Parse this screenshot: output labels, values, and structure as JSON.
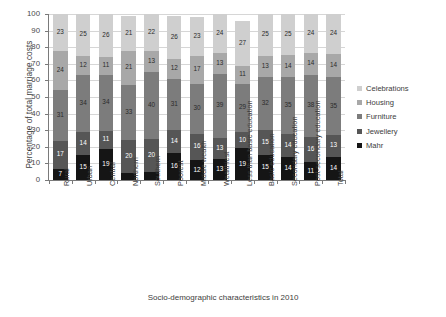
{
  "chart_data": {
    "type": "bar",
    "stacked": true,
    "title": "",
    "xlabel": "Socio-demographic characteristics in 2010",
    "ylabel": "Percentage of total marriage costs",
    "ylim": [
      0,
      100
    ],
    "ytick_step": 10,
    "yticks": [
      "100",
      "90",
      "80",
      "70",
      "60",
      "50",
      "40",
      "30",
      "20",
      "10",
      "0"
    ],
    "grid": true,
    "legend_position": "right",
    "categories": [
      "Rural",
      "Urban",
      "Central",
      "Northern",
      "Southern",
      "Poorest",
      "Middle wealth",
      "Wealthiest",
      "Less than basic education",
      "Basic education",
      "Secondary education",
      "Post-secondary education",
      "Total"
    ],
    "series": [
      {
        "name": "Mahr",
        "color": "#151515",
        "values": [
          7,
          15,
          19,
          4,
          5,
          16,
          12,
          13,
          19,
          15,
          14,
          11,
          14
        ]
      },
      {
        "name": "Jewellery",
        "color": "#565656",
        "values": [
          17,
          14,
          11,
          20,
          20,
          14,
          16,
          13,
          10,
          15,
          14,
          16,
          13
        ]
      },
      {
        "name": "Furniture",
        "color": "#7c7c7c",
        "values": [
          31,
          34,
          34,
          33,
          40,
          31,
          30,
          39,
          29,
          32,
          35,
          38,
          35
        ]
      },
      {
        "name": "Housing",
        "color": "#a8a8a8",
        "values": [
          24,
          12,
          11,
          21,
          13,
          12,
          17,
          13,
          11,
          13,
          14,
          14,
          14
        ]
      },
      {
        "name": "Celebrations",
        "color": "#cfcfcf",
        "values": [
          23,
          25,
          26,
          21,
          22,
          26,
          23,
          24,
          27,
          25,
          25,
          24,
          24
        ]
      }
    ],
    "legend_entries": [
      "Celebrations",
      "Housing",
      "Furniture",
      "Jewellery",
      "Mahr"
    ]
  }
}
